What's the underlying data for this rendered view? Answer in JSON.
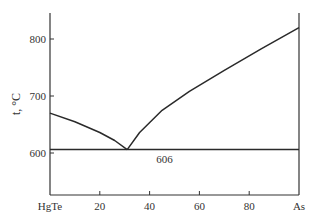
{
  "chart_data": {
    "type": "line",
    "title": "",
    "xlabel": "",
    "ylabel": "t, °C",
    "xlim": [
      0,
      100
    ],
    "ylim": [
      540,
      850
    ],
    "grid": false,
    "x_ticks": [
      {
        "value": 0,
        "label": "HgTe"
      },
      {
        "value": 20,
        "label": "20"
      },
      {
        "value": 40,
        "label": "40"
      },
      {
        "value": 60,
        "label": "60"
      },
      {
        "value": 80,
        "label": "80"
      },
      {
        "value": 100,
        "label": "As"
      }
    ],
    "y_ticks": [
      {
        "value": 600,
        "label": "600"
      },
      {
        "value": 700,
        "label": "700"
      },
      {
        "value": 800,
        "label": "800"
      }
    ],
    "series": [
      {
        "name": "liquidus",
        "x": [
          0,
          10,
          20,
          26,
          31,
          36,
          45,
          56,
          70,
          85,
          100
        ],
        "y": [
          670,
          655,
          636,
          622,
          606,
          636,
          675,
          708,
          745,
          783,
          820
        ]
      },
      {
        "name": "eutectic",
        "x": [
          0,
          100
        ],
        "y": [
          606,
          606
        ]
      }
    ],
    "annotations": [
      {
        "text": "606",
        "x": 46,
        "y": 606,
        "position": "below"
      }
    ]
  }
}
